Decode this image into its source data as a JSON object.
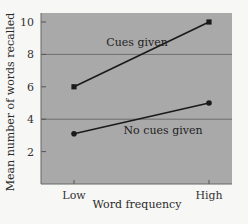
{
  "chart_data": {
    "type": "line",
    "title": "",
    "xlabel": "Word frequency",
    "ylabel": "Mean number of words recalled",
    "categories": [
      "Low",
      "High"
    ],
    "series": [
      {
        "name": "Cues given",
        "values": [
          6,
          10
        ],
        "marker": "square"
      },
      {
        "name": "No cues given",
        "values": [
          3.1,
          5
        ],
        "marker": "circle"
      }
    ],
    "ylim": [
      0,
      10.6
    ],
    "yticks": [
      2,
      4,
      6,
      8,
      10
    ],
    "grid": {
      "horizontal_lines_at": [
        4,
        8
      ]
    },
    "legend": "inline labels"
  },
  "colors": {
    "plot_background": "#a9a9a9",
    "page_background": "#f7f7f5",
    "line": "#1a1a1a",
    "gridline": "#6e6e6e"
  }
}
